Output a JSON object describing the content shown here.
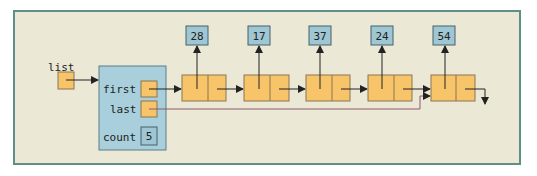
{
  "diagram": {
    "variable_label": "list",
    "header": {
      "fields": [
        {
          "label": "first",
          "type": "pointer"
        },
        {
          "label": "last",
          "type": "pointer"
        },
        {
          "label": "count",
          "type": "value",
          "value": "5"
        }
      ]
    },
    "nodes": [
      {
        "value": "28"
      },
      {
        "value": "17"
      },
      {
        "value": "37"
      },
      {
        "value": "24"
      },
      {
        "value": "54"
      }
    ],
    "colors": {
      "background": "#ebe8d5",
      "frame_border": "#5f8f85",
      "header_fill": "#a9cfdc",
      "value_fill": "#9fc6d3",
      "node_fill": "#f7c46a",
      "node_border": "#8a7650",
      "arrow": "#222222",
      "last_pointer_line": "#8a5a6a"
    }
  }
}
